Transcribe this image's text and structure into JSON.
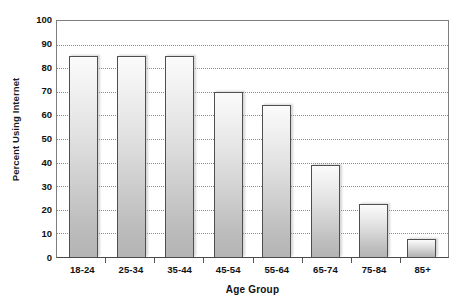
{
  "chart_data": {
    "type": "bar",
    "title": "",
    "xlabel": "Age Group",
    "ylabel": "Percent Using Internet",
    "categories": [
      "18-24",
      "25-34",
      "35-44",
      "45-54",
      "55-64",
      "65-74",
      "75-84",
      "85+"
    ],
    "values": [
      85,
      85,
      85,
      70,
      64.5,
      39,
      22.5,
      7.5
    ],
    "ylim": [
      0,
      100
    ],
    "y_ticks": [
      0,
      10,
      20,
      30,
      40,
      50,
      60,
      70,
      80,
      90,
      100
    ],
    "y_tick_labels": [
      "0",
      "10",
      "20",
      "30",
      "40",
      "50",
      "60",
      "70",
      "80",
      "90",
      "100"
    ],
    "grid": "horizontal-dotted",
    "legend": "none",
    "series": [
      {
        "name": "Percent Using Internet",
        "values": [
          85,
          85,
          85,
          70,
          64.5,
          39,
          22.5,
          7.5
        ]
      }
    ],
    "colors": {
      "bar_fill_top": "#fbfbfb",
      "bar_fill_bottom": "#b4b4b4",
      "bar_border": "#4f4f4f",
      "gridline": "#8e8e8e",
      "axis": "#4a4a4a",
      "text": "#111111",
      "background": "#ffffff"
    }
  }
}
